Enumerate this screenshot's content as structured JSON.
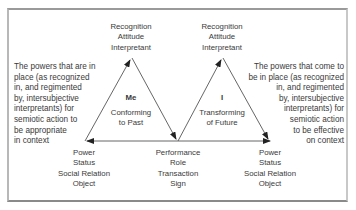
{
  "diagram": {
    "left_note": [
      "The powers that are in",
      "place (as recognized",
      "in, and regimented",
      "by, intersubjective",
      "interpretants) for",
      "semiotic action to",
      "be appropriate",
      "in context"
    ],
    "right_note": [
      "The powers that come to",
      "be in place (as recognized",
      "in, and regimented",
      "by, intersubjective",
      "interpretants) for",
      "semiotic action",
      "to be effective",
      "on context"
    ],
    "left_triangle": {
      "apex_label": [
        "Recognition",
        "Attitude",
        "Interpretant"
      ],
      "center_title": "Me",
      "center_sub": [
        "Conforming",
        "to Past"
      ],
      "base_left_label": [
        "Power",
        "Status",
        "Social Relation",
        "Object"
      ]
    },
    "right_triangle": {
      "apex_label": [
        "Recognition",
        "Attitude",
        "Interpretant"
      ],
      "center_title": "I",
      "center_sub": [
        "Transforming",
        "of Future"
      ],
      "base_right_label": [
        "Power",
        "Status",
        "Social Relation",
        "Object"
      ]
    },
    "shared_vertex_label": [
      "Performance",
      "Role",
      "Transaction",
      "Sign"
    ],
    "colors": {
      "line": "#555555",
      "text": "#3a3a3a"
    }
  }
}
